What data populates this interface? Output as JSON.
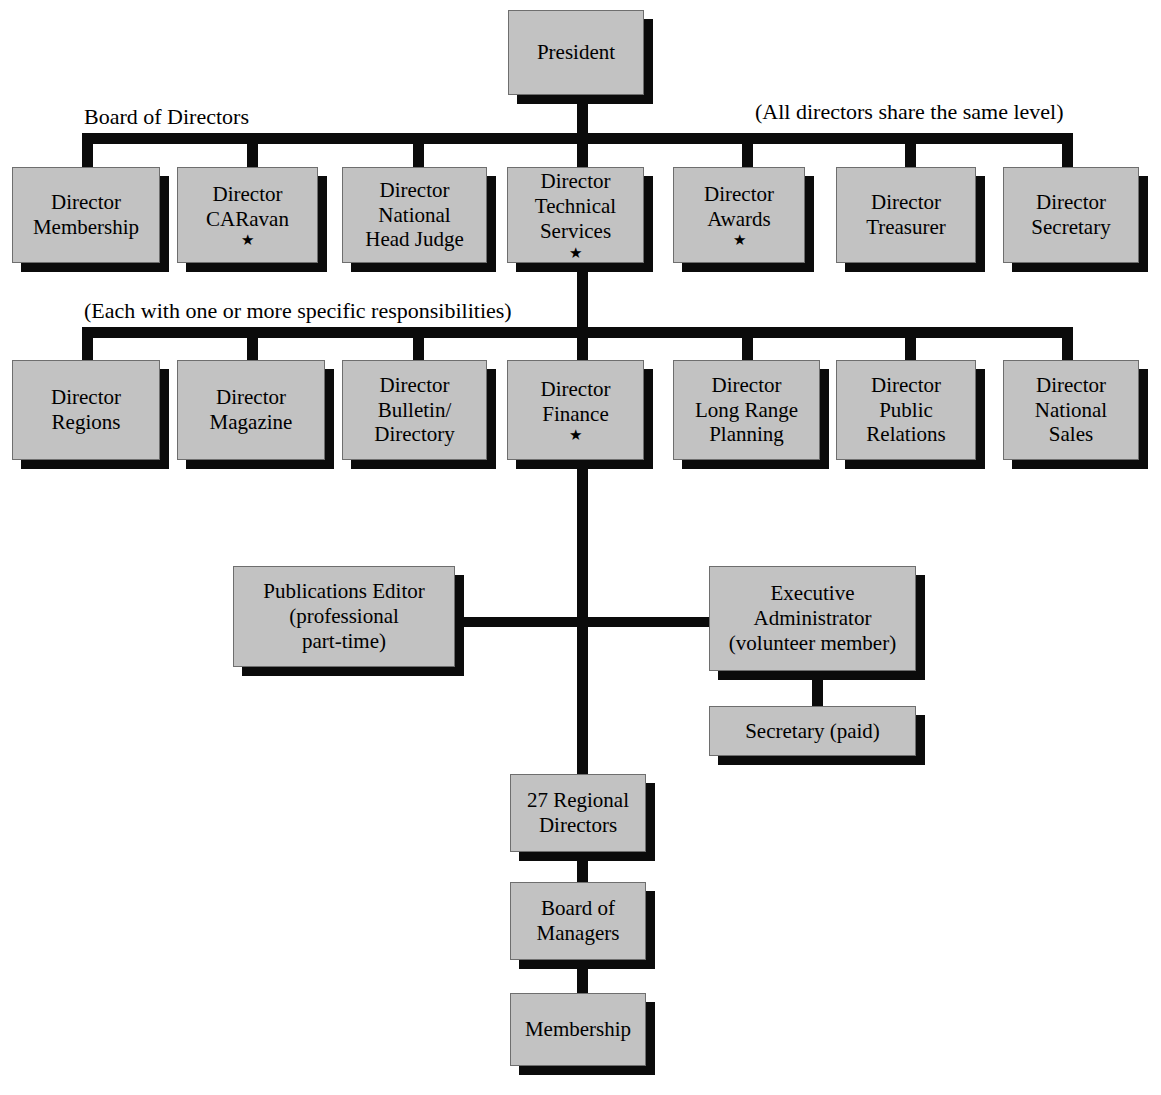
{
  "diagram": {
    "box_fill": "#c2c2c2",
    "box_border": "#6e6e6e",
    "line_color": "#0b0b0b",
    "shadow_color": "#0b0b0b",
    "background": "#ffffff"
  },
  "captions": {
    "board_of_directors": "Board of Directors",
    "all_directors_same_level": "(All directors share the same level)",
    "each_with_responsibilities": "(Each with one or more specific responsibilities)"
  },
  "nodes": {
    "president": {
      "lines": [
        "President"
      ],
      "star": ""
    },
    "director_membership": {
      "lines": [
        "Director",
        "Membership"
      ],
      "star": ""
    },
    "director_caravan": {
      "lines": [
        "Director",
        "CARavan"
      ],
      "star": "★"
    },
    "director_national_head_judge": {
      "lines": [
        "Director",
        "National",
        "Head Judge"
      ],
      "star": ""
    },
    "director_technical_services": {
      "lines": [
        "Director",
        "Technical",
        "Services"
      ],
      "star": "★"
    },
    "director_awards": {
      "lines": [
        "Director",
        "Awards"
      ],
      "star": "★"
    },
    "director_treasurer": {
      "lines": [
        "Director",
        "Treasurer"
      ],
      "star": ""
    },
    "director_secretary": {
      "lines": [
        "Director",
        "Secretary"
      ],
      "star": ""
    },
    "director_regions": {
      "lines": [
        "Director",
        "Regions"
      ],
      "star": ""
    },
    "director_magazine": {
      "lines": [
        "Director",
        "Magazine"
      ],
      "star": ""
    },
    "director_bulletin_directory": {
      "lines": [
        "Director",
        "Bulletin/",
        "Directory"
      ],
      "star": ""
    },
    "director_finance": {
      "lines": [
        "Director",
        "Finance"
      ],
      "star": "★"
    },
    "director_long_range_planning": {
      "lines": [
        "Director",
        "Long Range",
        "Planning"
      ],
      "star": ""
    },
    "director_public_relations": {
      "lines": [
        "Director",
        "Public",
        "Relations"
      ],
      "star": ""
    },
    "director_national_sales": {
      "lines": [
        "Director",
        "National",
        "Sales"
      ],
      "star": ""
    },
    "publications_editor": {
      "lines": [
        "Publications Editor",
        "(professional",
        "part-time)"
      ],
      "star": ""
    },
    "executive_administrator": {
      "lines": [
        "Executive",
        "Administrator",
        "(volunteer member)"
      ],
      "star": ""
    },
    "secretary_paid": {
      "lines": [
        "Secretary (paid)"
      ],
      "star": ""
    },
    "regional_directors": {
      "lines": [
        "27 Regional",
        "Directors"
      ],
      "star": ""
    },
    "board_of_managers": {
      "lines": [
        "Board of",
        "Managers"
      ],
      "star": ""
    },
    "membership": {
      "lines": [
        "Membership"
      ],
      "star": ""
    }
  }
}
